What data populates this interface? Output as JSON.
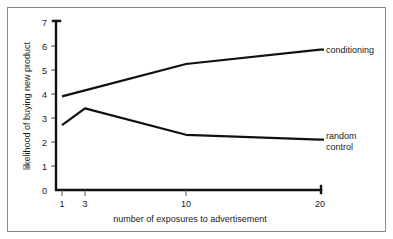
{
  "figure": {
    "frame_color": "#8a8a8a",
    "background": "#ffffff",
    "ink_color": "#111111"
  },
  "chart_data": {
    "type": "line",
    "title": "",
    "subtitle": "",
    "xlabel": "number of exposures to advertisement",
    "ylabel": "likelihood of buying new product",
    "x": [
      1,
      3,
      10,
      20
    ],
    "categories": [
      "1",
      "3",
      "10",
      "20"
    ],
    "xtick_labels": [
      "1",
      "3",
      "10",
      "20"
    ],
    "ytick_labels": [
      "0",
      "1",
      "2",
      "3",
      "4",
      "5",
      "6",
      "7"
    ],
    "ylim": [
      0,
      7
    ],
    "grid": false,
    "legend_position": "right-inline-annotation",
    "series": [
      {
        "name": "conditioning",
        "label": "conditioning",
        "values": [
          3.9,
          4.15,
          5.25,
          5.85
        ],
        "color": "#111111"
      },
      {
        "name": "random control",
        "label_lines": [
          "random",
          "control"
        ],
        "label": "random control",
        "values": [
          2.7,
          3.4,
          2.3,
          2.1
        ],
        "color": "#111111"
      }
    ]
  }
}
